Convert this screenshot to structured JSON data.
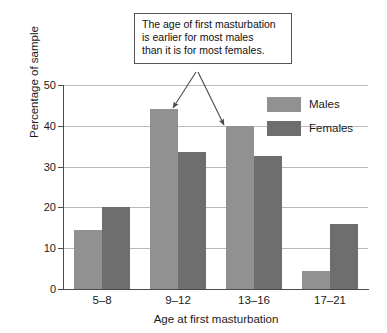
{
  "chart_data": {
    "type": "bar",
    "title": "",
    "xlabel": "Age at first masturbation",
    "ylabel": "Percentage of sample",
    "categories": [
      "5–8",
      "9–12",
      "13–16",
      "17–21"
    ],
    "series": [
      {
        "name": "Males",
        "color": "#919191",
        "values": [
          14.5,
          44,
          40,
          4.5
        ]
      },
      {
        "name": "Females",
        "color": "#6e6e6e",
        "values": [
          20,
          33.5,
          32.5,
          16
        ]
      }
    ],
    "ylim": [
      0,
      50
    ],
    "ytick_labels": [
      "0",
      "10",
      "20",
      "30",
      "40",
      "50"
    ],
    "ytick_values": [
      0,
      10,
      20,
      30,
      40,
      50
    ],
    "grid": true,
    "legend_position": "top-right"
  },
  "annotation": {
    "lines": [
      "The age of first masturbation",
      "is earlier for most males",
      "than it is for most females."
    ]
  },
  "legend": {
    "entries": [
      {
        "label": "Males"
      },
      {
        "label": "Females"
      }
    ]
  }
}
